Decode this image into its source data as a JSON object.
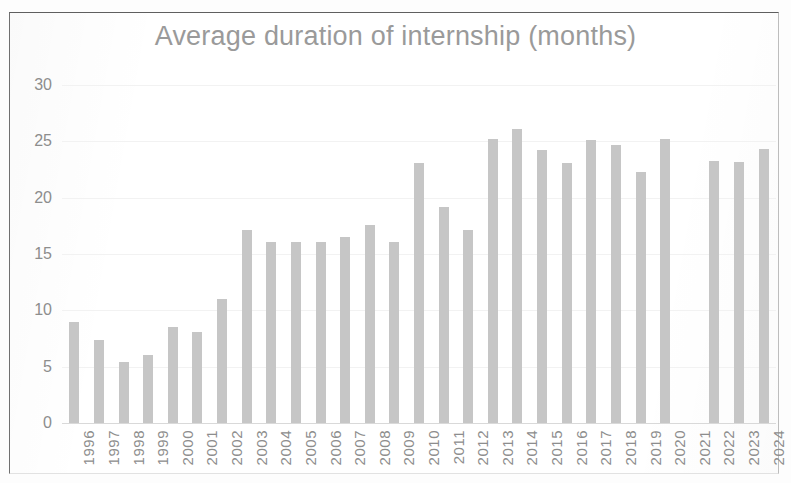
{
  "chart_data": {
    "type": "bar",
    "title": "Average duration of internship (months)",
    "xlabel": "",
    "ylabel": "",
    "ylim": [
      0,
      30
    ],
    "yticks": [
      0,
      5,
      10,
      15,
      20,
      25,
      30
    ],
    "grid": true,
    "legend": null,
    "bar_color": "#c6c6c6",
    "text_color": "#8d8d8d",
    "categories": [
      "1996",
      "1997",
      "1998",
      "1999",
      "2000",
      "2001",
      "2002",
      "2003",
      "2004",
      "2005",
      "2006",
      "2007",
      "2008",
      "2009",
      "2010",
      "2011",
      "2012",
      "2013",
      "2014",
      "2015",
      "2016",
      "2017",
      "2018",
      "2019",
      "2020",
      "2021",
      "2022",
      "2023",
      "2024"
    ],
    "values": [
      9.0,
      7.4,
      5.4,
      6.0,
      8.5,
      8.1,
      11.0,
      17.1,
      16.1,
      16.1,
      16.1,
      16.5,
      17.6,
      16.1,
      23.1,
      19.2,
      17.1,
      25.2,
      26.1,
      24.2,
      23.1,
      25.1,
      24.7,
      22.3,
      25.2,
      null,
      23.3,
      23.2,
      24.3
    ]
  }
}
